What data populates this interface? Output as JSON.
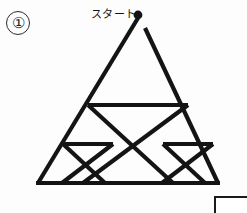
{
  "page": {
    "problem_number": "①",
    "start_label": "スタート",
    "background_color": "#fdfdfd",
    "ink_color": "#141414"
  },
  "figure": {
    "name": "sierpinski-triangle-one-stroke-puzzle",
    "stroke_color": "#141414",
    "stroke_width": 4.2,
    "start_dot": {
      "x": 138,
      "y": 15,
      "r": 4.4
    },
    "apex_gap": true,
    "vertices": {
      "apex": {
        "x": 138,
        "y": 16
      },
      "bottom_left": {
        "x": 38,
        "y": 183
      },
      "bottom_right": {
        "x": 218,
        "y": 183
      },
      "left_mid": {
        "x": 88,
        "y": 105
      },
      "right_mid": {
        "x": 188,
        "y": 105
      },
      "base_mid": {
        "x": 128,
        "y": 183
      },
      "left_quarter": {
        "x": 63,
        "y": 144
      },
      "right_quarter": {
        "x": 203,
        "y": 144
      },
      "base_left_quarter": {
        "x": 83,
        "y": 183
      },
      "base_right_quarter": {
        "x": 173,
        "y": 183
      },
      "left_sub_apex": {
        "x": 113,
        "y": 144
      },
      "right_sub_apex": {
        "x": 163,
        "y": 144
      }
    },
    "segments": [
      {
        "name": "outer-left-edge",
        "x1": 138,
        "y1": 18,
        "x2": 38,
        "y2": 183
      },
      {
        "name": "outer-right-edge",
        "x1": 145,
        "y1": 28,
        "x2": 218,
        "y2": 183
      },
      {
        "name": "outer-base",
        "x1": 36,
        "y1": 183,
        "x2": 220,
        "y2": 183
      },
      {
        "name": "upper-midline",
        "x1": 88,
        "y1": 105,
        "x2": 188,
        "y2": 105
      },
      {
        "name": "inner-left-diagonal",
        "x1": 88,
        "y1": 105,
        "x2": 173,
        "y2": 183
      },
      {
        "name": "inner-right-diagonal",
        "x1": 188,
        "y1": 105,
        "x2": 83,
        "y2": 183
      },
      {
        "name": "left-lower-midline",
        "x1": 63,
        "y1": 144,
        "x2": 113,
        "y2": 144
      },
      {
        "name": "right-lower-midline",
        "x1": 163,
        "y1": 144,
        "x2": 213,
        "y2": 144
      },
      {
        "name": "left-small-left-diagonal",
        "x1": 63,
        "y1": 144,
        "x2": 105,
        "y2": 183
      },
      {
        "name": "left-small-right-diagonal",
        "x1": 113,
        "y1": 144,
        "x2": 62,
        "y2": 183
      },
      {
        "name": "right-small-left-diagonal",
        "x1": 163,
        "y1": 144,
        "x2": 205,
        "y2": 183
      },
      {
        "name": "right-small-right-diagonal",
        "x1": 213,
        "y1": 144,
        "x2": 162,
        "y2": 183
      }
    ]
  },
  "answer_box": {
    "label": "",
    "visible": true
  }
}
